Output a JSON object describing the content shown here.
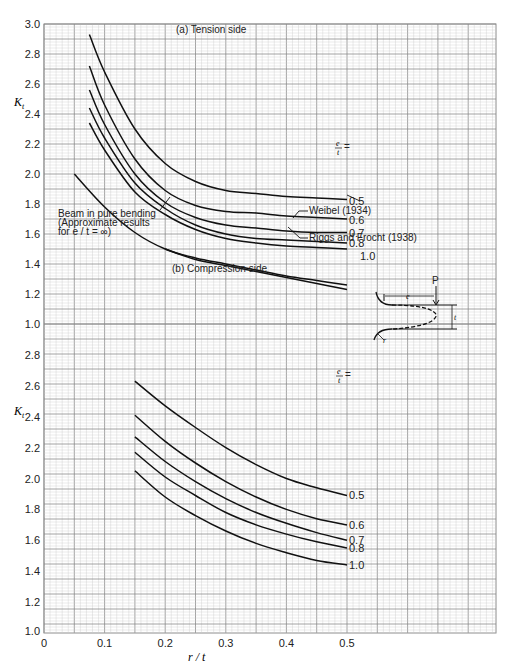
{
  "chart_data": [
    {
      "type": "line",
      "title": "(a) Tension side",
      "xlabel": "r / t",
      "ylabel": "Kt",
      "xlim": [
        0,
        0.75
      ],
      "ylim": [
        1.0,
        3.0
      ],
      "x_ticks": [
        "0",
        "0.1",
        "0.2",
        "0.3",
        "0.4",
        "0.5"
      ],
      "y_ticks": [
        "3.0",
        "2.8",
        "2.6",
        "2.4",
        "2.2",
        "2.0",
        "1.8",
        "1.6",
        "1.4",
        "1.2",
        "1.0"
      ],
      "grid": true,
      "legend_title": "e/t =",
      "series": [
        {
          "name": "0.5",
          "x": [
            0.075,
            0.1,
            0.15,
            0.2,
            0.25,
            0.3,
            0.35,
            0.4,
            0.45,
            0.5
          ],
          "y": [
            2.93,
            2.68,
            2.3,
            2.07,
            1.95,
            1.89,
            1.87,
            1.85,
            1.84,
            1.83
          ]
        },
        {
          "name": "0.6",
          "x": [
            0.075,
            0.1,
            0.15,
            0.2,
            0.25,
            0.3,
            0.35,
            0.4,
            0.45,
            0.5
          ],
          "y": [
            2.72,
            2.46,
            2.1,
            1.89,
            1.79,
            1.75,
            1.74,
            1.72,
            1.71,
            1.7
          ]
        },
        {
          "name": "0.7",
          "x": [
            0.075,
            0.1,
            0.15,
            0.2,
            0.25,
            0.3,
            0.35,
            0.4,
            0.45,
            0.5
          ],
          "y": [
            2.56,
            2.33,
            2.0,
            1.81,
            1.71,
            1.66,
            1.64,
            1.62,
            1.61,
            1.61
          ]
        },
        {
          "name": "0.8",
          "x": [
            0.075,
            0.1,
            0.15,
            0.2,
            0.25,
            0.3,
            0.35,
            0.4,
            0.45,
            0.5
          ],
          "y": [
            2.44,
            2.24,
            1.94,
            1.77,
            1.66,
            1.6,
            1.57,
            1.56,
            1.55,
            1.54
          ]
        },
        {
          "name": "1.0",
          "x": [
            0.075,
            0.1,
            0.15,
            0.2,
            0.25,
            0.3,
            0.35,
            0.4,
            0.45,
            0.5
          ],
          "y": [
            2.34,
            2.16,
            1.88,
            1.73,
            1.63,
            1.57,
            1.54,
            1.52,
            1.51,
            1.5
          ]
        },
        {
          "name": "Weibel (1934)",
          "x": [
            0.05,
            0.1,
            0.15,
            0.2,
            0.25,
            0.3,
            0.35,
            0.4,
            0.45,
            0.5
          ],
          "y": [
            2.0,
            1.78,
            1.61,
            1.5,
            1.44,
            1.4,
            1.36,
            1.32,
            1.29,
            1.26
          ]
        },
        {
          "name": "Riggs and Frocht (1938)",
          "x": [
            0.2,
            0.25,
            0.3,
            0.35,
            0.4,
            0.45,
            0.5
          ],
          "y": [
            1.5,
            1.43,
            1.39,
            1.35,
            1.31,
            1.27,
            1.23
          ]
        }
      ],
      "annotations": [
        "Beam in pure bending",
        "(Approximate results",
        "for e/t = ∞)",
        "Weibel (1934)",
        "Riggs and Frocht (1938)"
      ]
    },
    {
      "type": "line",
      "title": "(b) Compression side",
      "xlabel": "r / t",
      "ylabel": "Kt",
      "xlim": [
        0,
        0.75
      ],
      "ylim": [
        1.0,
        2.8
      ],
      "x_ticks": [
        "0",
        "0.1",
        "0.2",
        "0.3",
        "0.4",
        "0.5"
      ],
      "y_ticks": [
        "2.8",
        "2.6",
        "2.4",
        "2.2",
        "2.0",
        "1.8",
        "1.6",
        "1.4",
        "1.2",
        "1.0"
      ],
      "grid": true,
      "legend_title": "e/t =",
      "series": [
        {
          "name": "0.5",
          "x": [
            0.15,
            0.2,
            0.25,
            0.3,
            0.35,
            0.4,
            0.45,
            0.5
          ],
          "y": [
            2.63,
            2.47,
            2.33,
            2.2,
            2.09,
            2.0,
            1.94,
            1.89
          ]
        },
        {
          "name": "0.6",
          "x": [
            0.15,
            0.2,
            0.25,
            0.3,
            0.35,
            0.4,
            0.45,
            0.5
          ],
          "y": [
            2.41,
            2.24,
            2.1,
            1.98,
            1.88,
            1.8,
            1.74,
            1.7
          ]
        },
        {
          "name": "0.7",
          "x": [
            0.15,
            0.2,
            0.25,
            0.3,
            0.35,
            0.4,
            0.45,
            0.5
          ],
          "y": [
            2.27,
            2.11,
            1.98,
            1.87,
            1.78,
            1.71,
            1.65,
            1.6
          ]
        },
        {
          "name": "0.8",
          "x": [
            0.15,
            0.2,
            0.25,
            0.3,
            0.35,
            0.4,
            0.45,
            0.5
          ],
          "y": [
            2.17,
            2.01,
            1.89,
            1.78,
            1.7,
            1.64,
            1.59,
            1.55
          ]
        },
        {
          "name": "1.0",
          "x": [
            0.15,
            0.2,
            0.25,
            0.3,
            0.35,
            0.4,
            0.45,
            0.5
          ],
          "y": [
            2.05,
            1.88,
            1.76,
            1.66,
            1.58,
            1.52,
            1.47,
            1.44
          ]
        }
      ]
    }
  ],
  "labels": {
    "tension_title": "(a) Tension side",
    "compression_title": "(b) Compression side",
    "ylabel_K": "K",
    "ylabel_sub": "t",
    "xlabel": "r / t",
    "et_num": "e",
    "et_den": "t",
    "et_eq": "=",
    "beam_line1": "Beam in pure bending",
    "beam_line2": "(Approximate results",
    "beam_line3": "for e / t = ∞)",
    "weibel": "Weibel (1934)",
    "riggs": "Riggs and Frocht (1938)",
    "diagram_P": "P",
    "diagram_e": "e",
    "diagram_t": "t",
    "diagram_r": "r"
  },
  "axes": {
    "x_ticks": [
      {
        "v": 0,
        "label": "0"
      },
      {
        "v": 0.1,
        "label": "0.1"
      },
      {
        "v": 0.2,
        "label": "0.2"
      },
      {
        "v": 0.3,
        "label": "0.3"
      },
      {
        "v": 0.4,
        "label": "0.4"
      },
      {
        "v": 0.5,
        "label": "0.5"
      }
    ],
    "tension_y_ticks": [
      "3.0",
      "2.8",
      "2.6",
      "2.4",
      "2.2",
      "2.0",
      "1.8",
      "1.6",
      "1.4",
      "1.2",
      "1.0"
    ],
    "compression_y_ticks": [
      "2.8",
      "2.6",
      "2.4",
      "2.2",
      "2.0",
      "1.8",
      "1.6",
      "1.4",
      "1.2",
      "1.0"
    ]
  },
  "colors": {
    "grid_minor": "#c9c9c9",
    "grid_major": "#8c8c8c",
    "curve": "#111111",
    "background": "#ffffff"
  }
}
